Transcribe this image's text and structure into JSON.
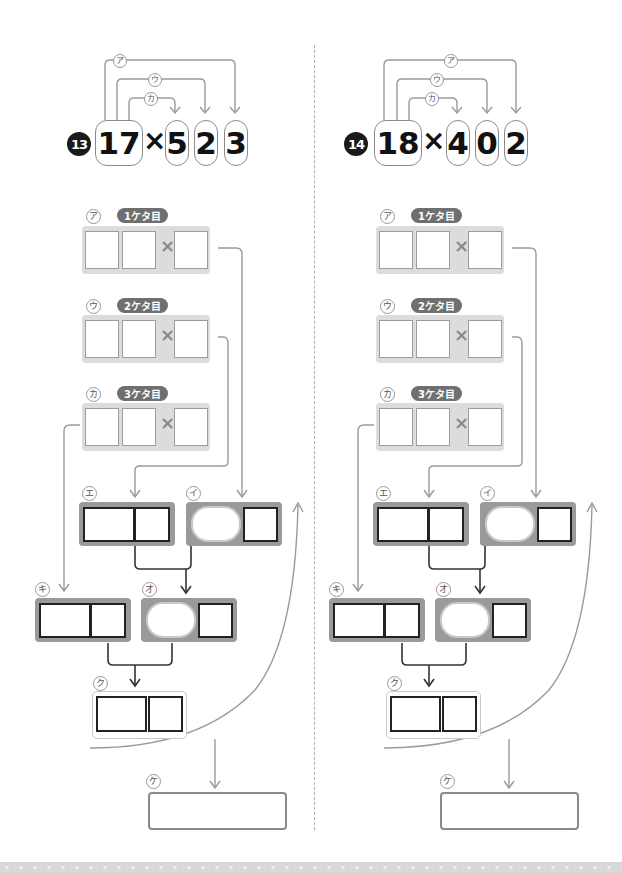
{
  "problems": [
    {
      "number": "13",
      "multiplicand": "17",
      "times_sign": "×",
      "multiplier_digits": [
        "5",
        "2",
        "3"
      ],
      "arrow_labels": [
        "ア",
        "ウ",
        "カ"
      ],
      "steps": [
        {
          "kana": "ア",
          "label": "1ケタ目",
          "times_sign": "×"
        },
        {
          "kana": "ウ",
          "label": "2ケタ目",
          "times_sign": "×"
        },
        {
          "kana": "カ",
          "label": "3ケタ目",
          "times_sign": "×"
        }
      ],
      "calc_boxes": {
        "e": "エ",
        "i": "イ",
        "ki": "キ",
        "o": "オ",
        "ku": "ク",
        "ke": "ケ"
      }
    },
    {
      "number": "14",
      "multiplicand": "18",
      "times_sign": "×",
      "multiplier_digits": [
        "4",
        "0",
        "2"
      ],
      "arrow_labels": [
        "ア",
        "ウ",
        "カ"
      ],
      "steps": [
        {
          "kana": "ア",
          "label": "1ケタ目",
          "times_sign": "×"
        },
        {
          "kana": "ウ",
          "label": "2ケタ目",
          "times_sign": "×"
        },
        {
          "kana": "カ",
          "label": "3ケタ目",
          "times_sign": "×"
        }
      ],
      "calc_boxes": {
        "e": "エ",
        "i": "イ",
        "ki": "キ",
        "o": "オ",
        "ku": "ク",
        "ke": "ケ"
      }
    }
  ],
  "colors": {
    "badge": "#1a1a1a",
    "step_pill": "#6f6f6f",
    "step_tray": "#dcdcdc",
    "calc_tray": "#9a9a9a",
    "connector": "#9a9a9a",
    "dark_connector": "#333333"
  }
}
